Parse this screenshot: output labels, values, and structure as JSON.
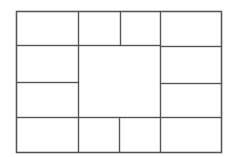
{
  "diagram": {
    "type": "rectangular-partition",
    "stroke_color": "#555555",
    "background": "#ffffff",
    "outer": {
      "x": 16,
      "y": 11,
      "w": 205,
      "h": 141
    },
    "cells": [
      {
        "id": "top-left",
        "x": 16,
        "y": 11,
        "w": 62,
        "h": 34
      },
      {
        "id": "top-mid-left",
        "x": 78,
        "y": 11,
        "w": 42,
        "h": 34
      },
      {
        "id": "top-mid-right",
        "x": 120,
        "y": 11,
        "w": 40,
        "h": 34
      },
      {
        "id": "top-right",
        "x": 160,
        "y": 11,
        "w": 61,
        "h": 35
      },
      {
        "id": "left-upper",
        "x": 16,
        "y": 45,
        "w": 62,
        "h": 37
      },
      {
        "id": "left-lower",
        "x": 16,
        "y": 82,
        "w": 62,
        "h": 35
      },
      {
        "id": "center",
        "x": 78,
        "y": 45,
        "w": 82,
        "h": 72
      },
      {
        "id": "right-upper",
        "x": 160,
        "y": 46,
        "w": 61,
        "h": 37
      },
      {
        "id": "right-lower",
        "x": 160,
        "y": 83,
        "w": 61,
        "h": 34
      },
      {
        "id": "bottom-left",
        "x": 16,
        "y": 117,
        "w": 62,
        "h": 35
      },
      {
        "id": "bottom-mid-left",
        "x": 78,
        "y": 117,
        "w": 41,
        "h": 35
      },
      {
        "id": "bottom-mid-right",
        "x": 119,
        "y": 117,
        "w": 41,
        "h": 35
      },
      {
        "id": "bottom-right",
        "x": 160,
        "y": 117,
        "w": 61,
        "h": 35
      }
    ]
  }
}
